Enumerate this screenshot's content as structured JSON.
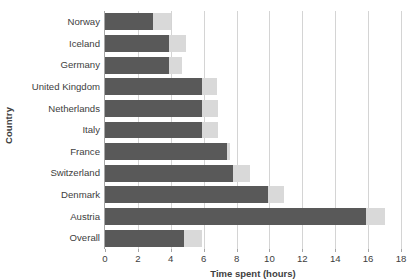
{
  "chart_data": {
    "type": "bar",
    "orientation": "horizontal",
    "stacked": true,
    "title": "",
    "xlabel": "Time spent (hours)",
    "ylabel": "Country",
    "xlim": [
      0,
      18
    ],
    "ylim": null,
    "grid": "vertical",
    "legend": "none",
    "xticks": [
      0,
      2,
      4,
      6,
      8,
      10,
      12,
      14,
      16,
      18
    ],
    "xtick_labels": [
      "0",
      "2",
      "4",
      "6",
      "8",
      "10",
      "12",
      "14",
      "16",
      "18"
    ],
    "categories": [
      "Norway",
      "Iceland",
      "Germany",
      "United Kingdom",
      "Netherlands",
      "Italy",
      "France",
      "Switzerland",
      "Denmark",
      "Austria",
      "Overall"
    ],
    "series": [
      {
        "name": "dark-segment",
        "color": "#595959",
        "values": [
          2.9,
          3.9,
          3.9,
          5.9,
          5.9,
          5.9,
          7.4,
          7.8,
          9.9,
          15.9,
          4.8
        ]
      },
      {
        "name": "light-segment",
        "color": "#d9d9d9",
        "values": [
          1.1,
          1.0,
          0.8,
          0.9,
          1.0,
          1.0,
          0.2,
          1.0,
          1.0,
          1.1,
          1.1
        ]
      }
    ],
    "totals": [
      4.0,
      4.9,
      4.7,
      6.8,
      6.9,
      6.9,
      7.6,
      8.8,
      10.9,
      17.0,
      5.9
    ]
  },
  "colors": {
    "dark_bar": "#595959",
    "light_bar": "#d9d9d9",
    "gridline": "#d4d4d4",
    "axis": "#a6a6a6",
    "text": "#404040",
    "background": "#ffffff"
  }
}
